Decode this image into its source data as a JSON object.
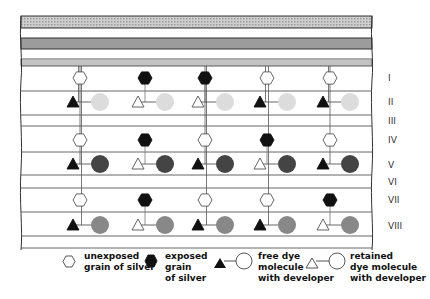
{
  "diagram": {
    "layers": [
      {
        "id": "I",
        "label": "I",
        "y": 78
      },
      {
        "id": "II",
        "label": "II",
        "y": 102
      },
      {
        "id": "III",
        "label": "III",
        "y": 121
      },
      {
        "id": "IV",
        "label": "IV",
        "y": 140
      },
      {
        "id": "V",
        "label": "V",
        "y": 165
      },
      {
        "id": "VI",
        "label": "VI",
        "y": 182
      },
      {
        "id": "VII",
        "label": "VII",
        "y": 200
      },
      {
        "id": "VIII",
        "label": "VIII",
        "y": 226
      }
    ],
    "dye_colors": {
      "layer_II": "#dcdcdc",
      "layer_V": "#444444",
      "layer_VIII": "#888888"
    },
    "columns": [
      {
        "x": 80,
        "silver": [
          "unexposed",
          "unexposed",
          "unexposed"
        ],
        "dye": [
          "free",
          "free",
          "free"
        ]
      },
      {
        "x": 145,
        "silver": [
          "exposed",
          "exposed",
          "exposed"
        ],
        "dye": [
          "retained",
          "retained",
          "retained"
        ]
      },
      {
        "x": 205,
        "silver": [
          "exposed",
          "unexposed",
          "unexposed"
        ],
        "dye": [
          "retained",
          "free",
          "free"
        ]
      },
      {
        "x": 267,
        "silver": [
          "unexposed",
          "exposed",
          "unexposed"
        ],
        "dye": [
          "free",
          "retained",
          "free"
        ]
      },
      {
        "x": 330,
        "silver": [
          "unexposed",
          "unexposed",
          "exposed"
        ],
        "dye": [
          "free",
          "free",
          "retained"
        ]
      }
    ]
  },
  "legend": {
    "unexposed": {
      "line1": "unexposed",
      "line2": "grain of silver"
    },
    "exposed": {
      "line1": "exposed",
      "line2": "grain",
      "line3": "of silver"
    },
    "free_dye": {
      "line1": "free dye",
      "line2": "molecule",
      "line3": "with developer"
    },
    "retained_dye": {
      "line1": "retained",
      "line2": "dye molecule",
      "line3": "with developer"
    }
  }
}
